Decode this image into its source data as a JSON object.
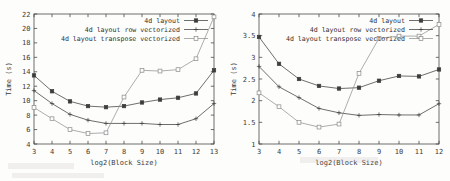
{
  "figure": {
    "panel_count": 2,
    "background_color": "#fdfdfc",
    "ink_color": "#3d3d3d"
  },
  "chart_data": [
    {
      "type": "line",
      "title": "",
      "xlabel": "log2(Block Size)",
      "ylabel": "Time (s)",
      "xlim": [
        3,
        13
      ],
      "ylim": [
        4,
        22
      ],
      "xticks": [
        3,
        4,
        5,
        6,
        7,
        8,
        9,
        10,
        11,
        12,
        13
      ],
      "yticks": [
        4,
        6,
        8,
        10,
        12,
        14,
        16,
        18,
        20,
        22
      ],
      "xtick_labels": [
        "3",
        "4",
        "5",
        "6",
        "7",
        "8",
        "9",
        "10",
        "11",
        "12",
        "13"
      ],
      "ytick_labels": [
        "4",
        "6",
        "8",
        "10",
        "12",
        "14",
        "16",
        "18",
        "20",
        "22"
      ],
      "grid": false,
      "legend_position": "top-right",
      "x": [
        3,
        4,
        5,
        6,
        7,
        8,
        9,
        10,
        11,
        12,
        13
      ],
      "series": [
        {
          "name": "4d layout",
          "marker": "filled-square",
          "values": [
            13.5,
            11.3,
            9.9,
            9.25,
            9.1,
            9.25,
            9.75,
            10.15,
            10.4,
            11.0,
            14.2
          ]
        },
        {
          "name": "4d layout row vectorized",
          "marker": "plus",
          "values": [
            11.4,
            9.6,
            8.1,
            7.3,
            6.85,
            6.85,
            6.85,
            6.7,
            6.7,
            7.5,
            9.6
          ]
        },
        {
          "name": "4d layout transpose vectorized",
          "marker": "open-square",
          "values": [
            9.05,
            7.5,
            6.0,
            5.45,
            5.55,
            10.5,
            14.2,
            14.1,
            14.3,
            15.8,
            21.6
          ]
        }
      ]
    },
    {
      "type": "line",
      "title": "",
      "xlabel": "log2(Block Size)",
      "ylabel": "Time (s)",
      "xlim": [
        3,
        12
      ],
      "ylim": [
        1,
        4
      ],
      "xticks": [
        3,
        4,
        5,
        6,
        7,
        8,
        9,
        10,
        11,
        12
      ],
      "yticks": [
        1,
        1.5,
        2,
        2.5,
        3,
        3.5,
        4
      ],
      "xtick_labels": [
        "3",
        "4",
        "5",
        "6",
        "7",
        "8",
        "9",
        "10",
        "11",
        "12"
      ],
      "ytick_labels": [
        "1",
        "1.5",
        "2",
        "2.5",
        "3",
        "3.5",
        "4"
      ],
      "grid": false,
      "legend_position": "top-right",
      "x": [
        3,
        4,
        5,
        6,
        7,
        8,
        9,
        10,
        11,
        12
      ],
      "series": [
        {
          "name": "4d layout",
          "marker": "filled-square",
          "values": [
            3.47,
            2.85,
            2.5,
            2.34,
            2.28,
            2.3,
            2.46,
            2.57,
            2.56,
            2.72
          ]
        },
        {
          "name": "4d layout row vectorized",
          "marker": "plus",
          "values": [
            2.79,
            2.32,
            2.07,
            1.82,
            1.72,
            1.66,
            1.68,
            1.67,
            1.67,
            1.93
          ]
        },
        {
          "name": "4d layout transpose vectorized",
          "marker": "open-square",
          "values": [
            2.18,
            1.86,
            1.5,
            1.39,
            1.46,
            2.63,
            3.44,
            3.49,
            3.49,
            3.76
          ]
        }
      ]
    }
  ]
}
